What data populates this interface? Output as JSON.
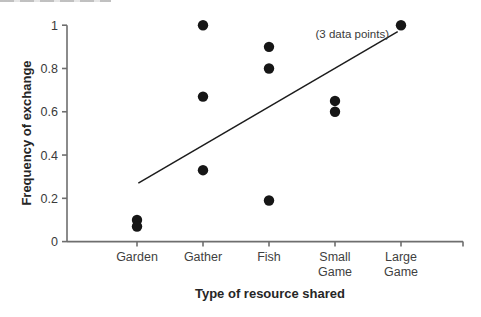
{
  "chart_data": {
    "type": "scatter",
    "title": "",
    "xlabel": "Type of resource shared",
    "ylabel": "Frequency of exchange",
    "categories": [
      "Garden",
      "Gather",
      "Fish",
      "Small Game",
      "Large Game"
    ],
    "category_label_lines": [
      [
        "Garden"
      ],
      [
        "Gather"
      ],
      [
        "Fish"
      ],
      [
        "Small",
        "Game"
      ],
      [
        "Large",
        "Game"
      ]
    ],
    "y_ticks": [
      {
        "value": 0,
        "label": "0"
      },
      {
        "value": 0.2,
        "label": "0.2"
      },
      {
        "value": 0.4,
        "label": "0.4"
      },
      {
        "value": 0.6,
        "label": "0.6"
      },
      {
        "value": 0.8,
        "label": "0.8"
      },
      {
        "value": 1,
        "label": "1"
      }
    ],
    "ylim": [
      0,
      1
    ],
    "grid": false,
    "legend": null,
    "points": [
      {
        "category": "Garden",
        "value": 0.1,
        "count": 1
      },
      {
        "category": "Garden",
        "value": 0.07,
        "count": 1
      },
      {
        "category": "Gather",
        "value": 1.0,
        "count": 1
      },
      {
        "category": "Gather",
        "value": 0.67,
        "count": 1
      },
      {
        "category": "Gather",
        "value": 0.33,
        "count": 1
      },
      {
        "category": "Fish",
        "value": 0.9,
        "count": 1
      },
      {
        "category": "Fish",
        "value": 0.8,
        "count": 1
      },
      {
        "category": "Fish",
        "value": 0.19,
        "count": 1
      },
      {
        "category": "Small Game",
        "value": 0.65,
        "count": 1
      },
      {
        "category": "Small Game",
        "value": 0.6,
        "count": 1
      },
      {
        "category": "Large Game",
        "value": 1.0,
        "count": 3
      }
    ],
    "trendline": {
      "x1_cat": 0.02,
      "y1": 0.27,
      "x2_cat": 3.95,
      "y2": 0.97
    },
    "annotation": {
      "text": "(3 data points)",
      "refers_to": "Large Game value 1.00"
    },
    "colors": {
      "point": "#161616",
      "trendline": "#1c1c1c",
      "axis": "#6e6e6e",
      "tick_text": "#3a3a3a",
      "category_text": "#3f3f3f",
      "title_text": "#262626"
    }
  }
}
